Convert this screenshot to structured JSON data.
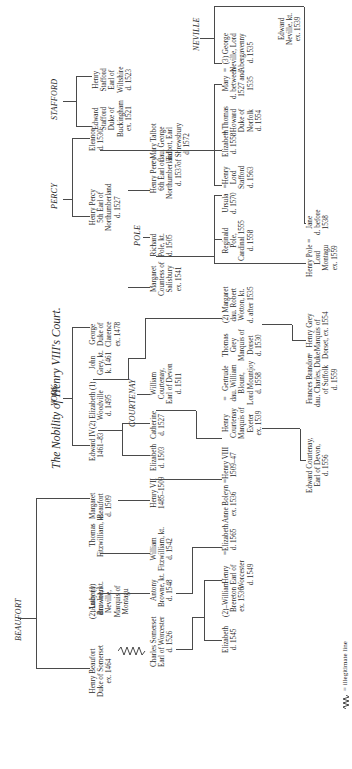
{
  "title": "The Nobility of Henry VIII's Court.",
  "houses": {
    "beaufort": "BEAUFORT",
    "york": "YORK",
    "percy": "PERCY",
    "stafford": "STAFFORD",
    "neville": "NEVILLE",
    "courtenay": "COURTENAY",
    "pole": "POLE"
  },
  "people": {
    "henry_beaufort": "Henry Beaufort\nDuke of Somerset\nex. 1464",
    "anthony_browne": "Anthony\nBrowne, kt.",
    "lucy": "(2) Lucy (1)\ndau. John\nNeville,\nMarquis of\nMontagu",
    "thomas_fitzwilliam": "Thomas\nFitzwilliam, kt.",
    "margaret_beaufort": "Margaret\nBeaufort\nd. 1509",
    "edward_iv": "Edward IV\n1461–83",
    "elizabeth_woodville": "(2) Elizabeth (1)\nWoodville\nd. 1495",
    "john_grey": "John\nGrey, kt.\nk. 1461",
    "george_clarence": "George\nDuke of\nClarence\nex. 1478",
    "henry_percy_5": "Henry Percy\n5th Earl of\nNorthumberland\nd. 1527",
    "eleanor": "Eleanor\nd. 1530",
    "edward_stafford": "Edward\nStafford\nDuke of\nBuckingham\nex. 1521",
    "henry_stafford_wilts": "Henry\nStafford\nEarl of\nWiltshire\nd. 1523",
    "charles_somerset": "Charles Somerset\nEarl of Worcester\nd. 1526",
    "antony_browne": "Antony\nBrowne, kt.\nd. 1548",
    "william_fitzwilliam": "William\nFitzwilliam, kt.\nd. 1542",
    "henry_vii": "Henry VII\n1485–1509",
    "elizabeth_1503": "Elizabeth\nd. 1503",
    "catherine": "Catherine\nd. 1527",
    "william_courtenay": "William\nCourtenay,\nEarl of Devon\nd. 1511",
    "thomas_grey": "Thomas\nGrey\nMarquis of\nDorset\nd. 1530",
    "margaret_wotton": "(2) Margaret\ndau. Robert\nWotton, kt.\nd. after 1535",
    "margaret_salisbury": "Margaret\nCountess of\nSalisbury\nex. 1541",
    "richard_pole": "Richard\nPole, kt.\nd. 1505",
    "henry_percy_6": "Henry Percy\n6th Earl of\nNorthumberland\nd. 1537",
    "mary_talbot": "= Mary Talbot\ndau. George\nTalbot, Earl\nof Shrewsbury\nd. 1572",
    "elizabeth_2": "Elizabeth\nd. 1545",
    "william_brereton": "(2)–William\nBrereton\nex. 1536",
    "henry_worcester": "Henry\nEarl of\nWorcester\nd. 1549",
    "elizabeth_1565": "=Elizabeth\nd. 1565",
    "anne_boleyn": "Anne Boleyn\nex. 1536",
    "henry_viii": "=Henry VIII\n1509–47",
    "henry_courtenay": "Henry\nCourtenay\nMarquis of\nExeter\nex. 1539",
    "gertrude": "=   Gertrude\ndau. William\nBlount,\nLord Mountjoy\nd. 1558",
    "reginald_pole": "Reginald\nPole,\nCardinal 1555\nd. 1558",
    "ursula": "Ursula\nd. 1570",
    "henry_stafford_lord": "=Henry\nLord\nStafford\nd. 1563",
    "elizabeth_1558": "Elizabeth\nd. 1558",
    "thomas_howard": "= Thomas\nHoward\nDuke of\nNorfolk\nd. 1554",
    "mary_neville": "Mary\nd. between\n1527 and\n1535",
    "george_neville": "=  (3) George\nNeville, Lord\nAbergavenny\nd. 1535",
    "edward_neville": "Edward\nNeville, kt.\nex. 1539",
    "edward_courtenay": "Edward Courtenay,\nEarl of Devon,\nd. 1556",
    "frances_brandon": "Frances Brandon\ndau. Charles, Duke\nof Suffolk\nd. 1559",
    "henry_grey": "=   Henry Grey\nMarquis of\nDorset, ex. 1554",
    "henry_pole": "Henry Pole =\nLord\nMontagu\nex. 1559",
    "jane": "Jane\nd. before\n1538"
  },
  "legend": {
    "symbol": "illegitimate-line",
    "label": "= illegitimate line"
  }
}
